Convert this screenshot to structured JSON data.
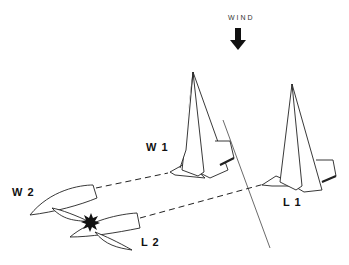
{
  "diagram": {
    "wind_label": "WIND",
    "boats": [
      {
        "id": "W1",
        "label": "W 1"
      },
      {
        "id": "L1",
        "label": "L 1"
      },
      {
        "id": "W2",
        "label": "W 2"
      },
      {
        "id": "L2",
        "label": "L 2"
      }
    ],
    "colors": {
      "stroke": "#222222",
      "background": "#ffffff"
    }
  }
}
